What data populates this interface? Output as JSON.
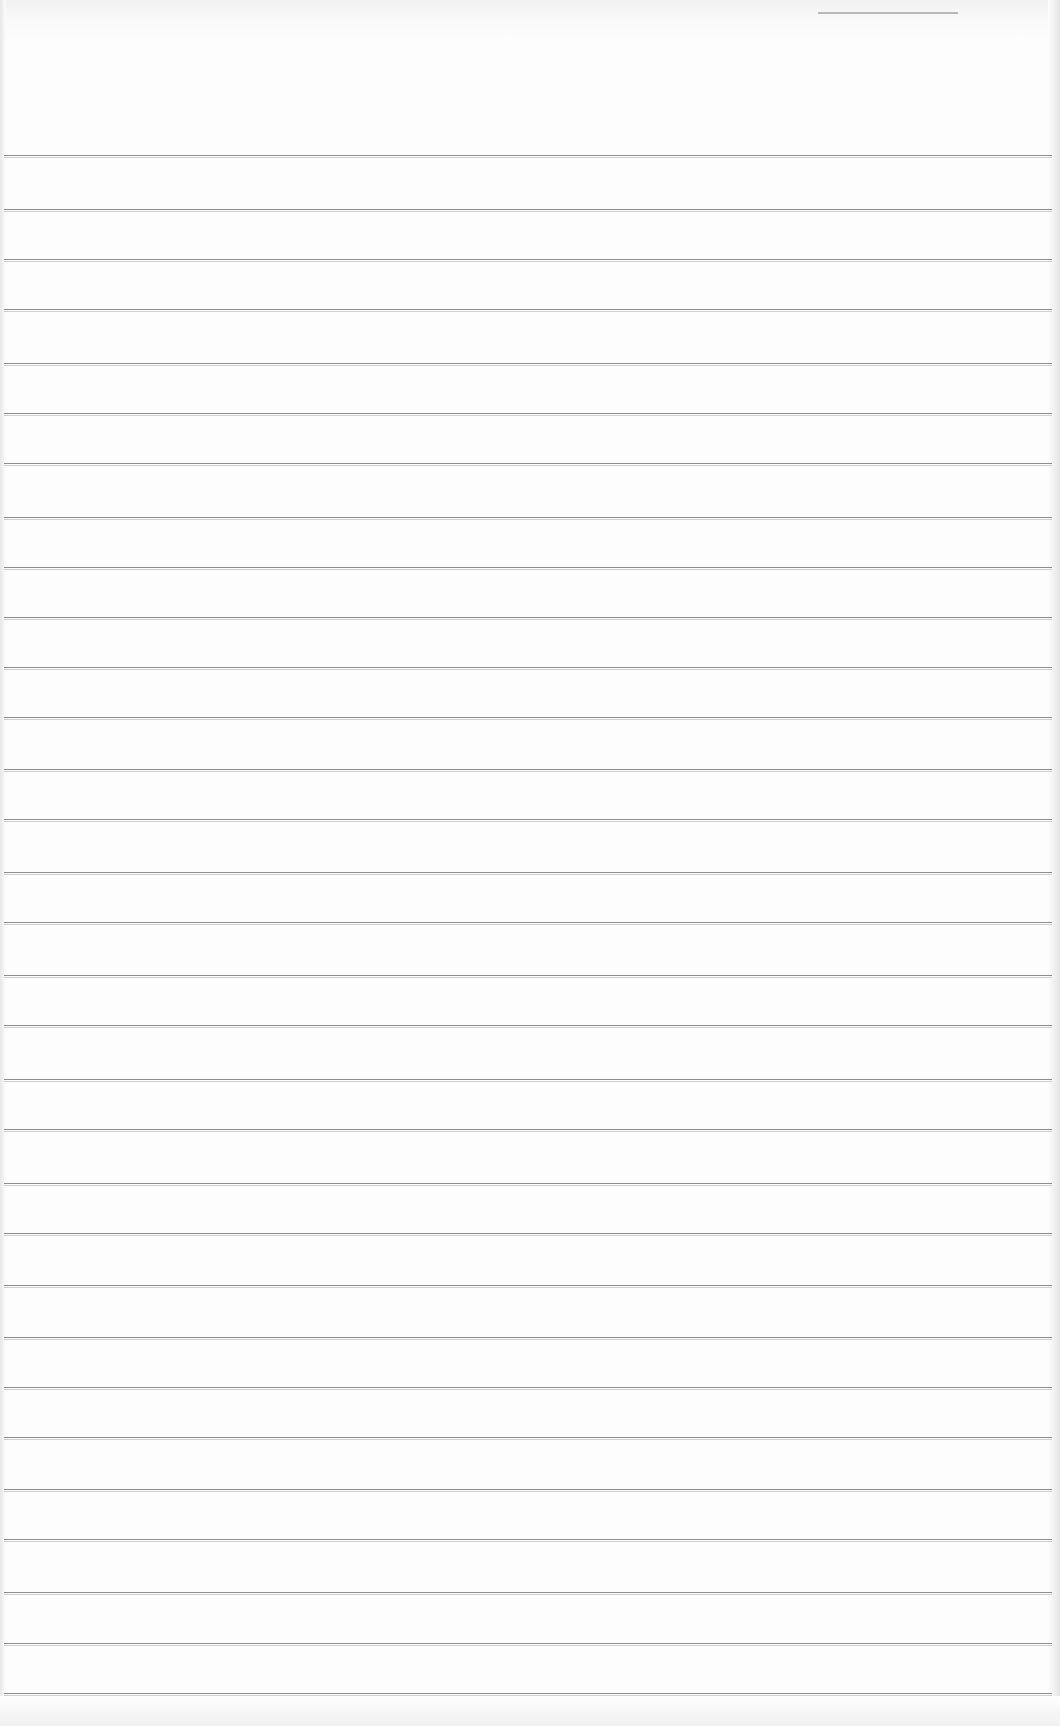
{
  "document": {
    "type": "blank ruled notepad page",
    "text_content": "",
    "paper_color": "#fdfdfd",
    "rule_color": "#8e8e8e",
    "rule_count": 31,
    "rule_positions_y": [
      155,
      209,
      259,
      309,
      363,
      413,
      463,
      517,
      567,
      617,
      667,
      717,
      769,
      819,
      872,
      922,
      975,
      1025,
      1079,
      1129,
      1183,
      1233,
      1285,
      1337,
      1387,
      1437,
      1489,
      1539,
      1592,
      1643,
      1693
    ],
    "rule_left_x": 4,
    "rule_right_x": 1052
  }
}
